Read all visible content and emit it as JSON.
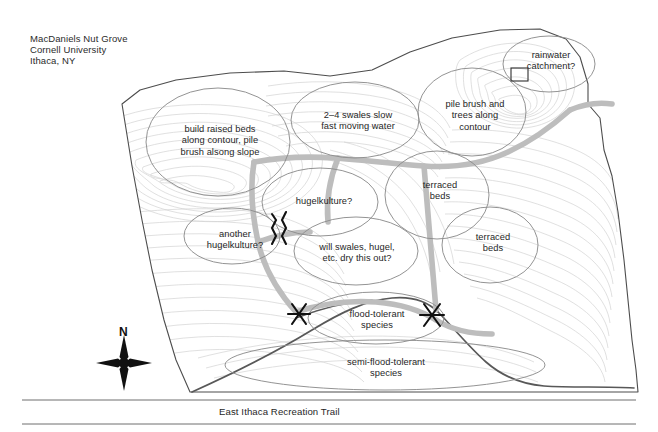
{
  "title_block": {
    "line1": "MacDaniels Nut Grove",
    "line2": "Cornell University",
    "line3": "Ithaca, NY"
  },
  "map": {
    "type": "annotated-site-plan",
    "description": "Topographic contour site plan of MacDaniels Nut Grove with hand-drawn permaculture design annotations",
    "colors": {
      "background": "#ffffff",
      "contour_line": "#cfcfcf",
      "site_boundary": "#4a4a4a",
      "creek_boundary": "#555555",
      "annotation_ellipse": "#8a8a8a",
      "swale_path": "#b9b9b9",
      "marker": "#111111",
      "text": "#1f1f1f",
      "trail_rule": "#6e6e6e"
    },
    "annotations": [
      {
        "id": "raised-beds",
        "text": "build raised beds\nalong contour, pile\nbrush alsong slope",
        "x": 160,
        "y": 124,
        "width": 120
      },
      {
        "id": "swales",
        "text": "2–4 swales slow\nfast moving water",
        "x": 302,
        "y": 110,
        "width": 112
      },
      {
        "id": "pile-brush",
        "text": "pile brush and\ntrees along\ncontour",
        "x": 427,
        "y": 99,
        "width": 96
      },
      {
        "id": "rainwater",
        "text": "rainwater\ncatchment?",
        "x": 509,
        "y": 50,
        "width": 84
      },
      {
        "id": "hugelkulture",
        "text": "hugelkulture?",
        "x": 282,
        "y": 196,
        "width": 84
      },
      {
        "id": "another-hugelkulture",
        "text": "another\nhugelkulture?",
        "x": 192,
        "y": 229,
        "width": 86
      },
      {
        "id": "dry-out",
        "text": "will swales, hugel,\netc. dry this out?",
        "x": 301,
        "y": 242,
        "width": 112
      },
      {
        "id": "terraced-beds-upper",
        "text": "terraced\nbeds",
        "x": 405,
        "y": 180,
        "width": 70
      },
      {
        "id": "terraced-beds-lower",
        "text": "terraced\nbeds",
        "x": 458,
        "y": 232,
        "width": 70
      },
      {
        "id": "flood-tolerant",
        "text": "flood-tolerant\nspecies",
        "x": 329,
        "y": 309,
        "width": 96
      },
      {
        "id": "semi-flood-tolerant",
        "text": "semi-flood-tolerant\nspecies",
        "x": 324,
        "y": 357,
        "width": 124
      }
    ],
    "compass": {
      "label": "N"
    },
    "trail": {
      "label": "East Ithaca Recreation Trail"
    }
  }
}
